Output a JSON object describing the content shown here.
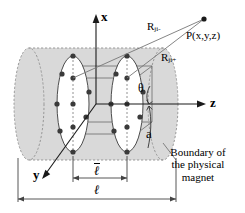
{
  "figure": {
    "axes": {
      "x_label": "x",
      "y_label": "y",
      "z_label": "z"
    },
    "labels": {
      "point": "P(x,y,z)",
      "r_minus_base": "R",
      "r_minus_sub": "ji-",
      "r_plus_base": "R",
      "r_plus_sub": "ji+",
      "theta": "θ",
      "radius": "a",
      "inner_length": "ℓ",
      "outer_length": "ℓ",
      "boundary_line1": "Boundary of",
      "boundary_line2": "the physical",
      "boundary_line3": "magnet"
    },
    "colors": {
      "cylinder_fill": "#d9d9d9",
      "cylinder_stroke": "#8c8c8c",
      "ellipse_fill": "#ffffff",
      "ellipse_stroke": "#4d4d4d",
      "dot_fill": "#3a3a3a",
      "line": "#555555",
      "axis": "#1a1a1a",
      "text": "#000000"
    },
    "geometry": {
      "cylinder_left_cap_cx": 29,
      "cylinder_right_cap_cx": 163,
      "cylinder_cap_rx": 15,
      "cylinder_cap_ry": 56,
      "cylinder_mid_y": 104,
      "loop_left_cx": 73,
      "loop_right_cx": 127,
      "loop_rx": 16,
      "loop_ry": 48,
      "origin_x": 96,
      "origin_y": 104,
      "point_x": 204,
      "point_y": 19
    }
  }
}
